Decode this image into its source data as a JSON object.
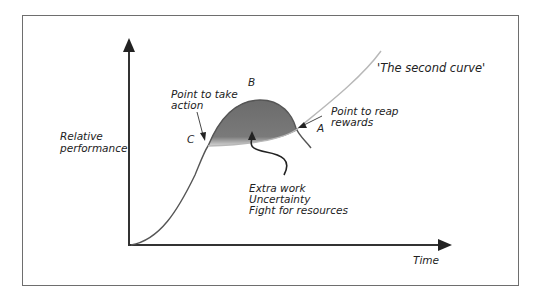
{
  "diagram": {
    "y_axis_label_line1": "Relative",
    "y_axis_label_line2": "performance",
    "x_axis_label": "Time",
    "second_curve_label": "'The second curve'",
    "point_b": "B",
    "point_c": "C",
    "point_a": "A",
    "take_action_line1": "Point to take",
    "take_action_line2": "action",
    "reap_rewards_line1": "Point to reap",
    "reap_rewards_line2": "rewards",
    "notes": [
      "Extra work",
      "Uncertainty",
      "Fight for resources"
    ],
    "colors": {
      "axis": "#333333",
      "curve": "#5a5a5a",
      "shade": "#6b6b6b",
      "second_curve": "#b8b8b8",
      "frame": "#6e6e6e"
    }
  }
}
